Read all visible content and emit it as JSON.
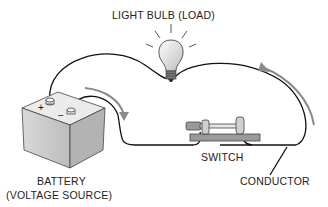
{
  "diagram": {
    "labels": {
      "bulb": "LIGHT BULB (LOAD)",
      "switch": "SWITCH",
      "battery_line1": "BATTERY",
      "battery_line2": "(VOLTAGE SOURCE)",
      "conductor": "CONDUCTOR"
    },
    "terminals": {
      "positive": "+",
      "negative": "−"
    },
    "colors": {
      "wire": "#111111",
      "arrow": "#8a8a8a",
      "battery_fill": "#cfcfcf",
      "switch_base": "#9a9a9a"
    }
  }
}
